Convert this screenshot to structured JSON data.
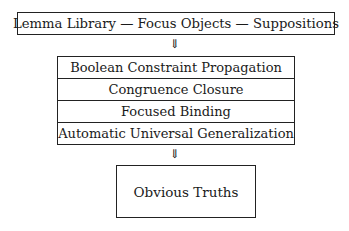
{
  "diagram": {
    "type": "flow",
    "top": {
      "label": "Lemma Library — Focus Objects — Suppositions"
    },
    "arrows": [
      "⇓",
      "⇓"
    ],
    "middle": {
      "rows": [
        {
          "label": "Boolean Constraint Propagation"
        },
        {
          "label": "Congruence Closure"
        },
        {
          "label": "Focused Binding"
        },
        {
          "label": "Automatic Universal Generalization"
        }
      ]
    },
    "bottom": {
      "label": "Obvious Truths"
    }
  }
}
